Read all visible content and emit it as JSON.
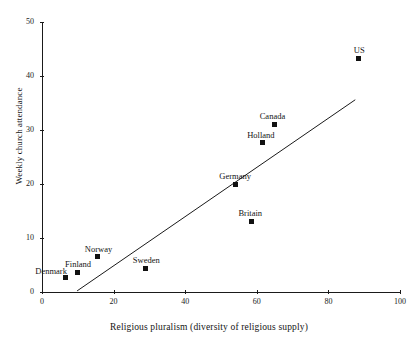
{
  "chart_data": {
    "type": "scatter",
    "title": "",
    "xlabel": "Religious pluralism (diversity of religious supply)",
    "ylabel": "Weekly church attendance",
    "xlim": [
      0,
      100
    ],
    "ylim": [
      0,
      50
    ],
    "xticks": [
      0,
      20,
      40,
      60,
      80,
      100
    ],
    "yticks": [
      0,
      10,
      20,
      30,
      40,
      50
    ],
    "grid": false,
    "legend": "none",
    "points": [
      {
        "label": "Denmark",
        "x": 6.5,
        "y": 2.6,
        "label_dx": -30,
        "label_dy": -11
      },
      {
        "label": "Finland",
        "x": 9.8,
        "y": 3.7,
        "label_dx": -12,
        "label_dy": -12
      },
      {
        "label": "Norway",
        "x": 15.6,
        "y": 6.5,
        "label_dx": -13,
        "label_dy": -12
      },
      {
        "label": "Sweden",
        "x": 29.0,
        "y": 4.4,
        "label_dx": -13,
        "label_dy": -12
      },
      {
        "label": "Germany",
        "x": 54.0,
        "y": 20.0,
        "label_dx": -16,
        "label_dy": -12
      },
      {
        "label": "Britain",
        "x": 58.5,
        "y": 13.1,
        "label_dx": -13,
        "label_dy": -12
      },
      {
        "label": "Holland",
        "x": 61.5,
        "y": 27.6,
        "label_dx": -15,
        "label_dy": -12
      },
      {
        "label": "Canada",
        "x": 65.0,
        "y": 31.1,
        "label_dx": -15,
        "label_dy": -12
      },
      {
        "label": "US",
        "x": 88.5,
        "y": 43.3,
        "label_dx": -5,
        "label_dy": -12
      }
    ],
    "trend_line": {
      "name": "fitted regression line",
      "x0": 9.8,
      "y0": 0.2,
      "x1": 87.5,
      "y1": 35.6
    }
  }
}
